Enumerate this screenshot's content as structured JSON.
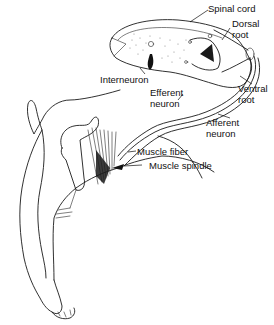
{
  "figure": {
    "colors": {
      "ink": "#1a1a1a",
      "background": "#ffffff",
      "stipple": "#8a8a8a"
    }
  },
  "labels": {
    "spinal_cord": "Spinal cord",
    "dorsal_root_1": "Dorsal",
    "dorsal_root_2": "root",
    "interneuron": "Interneuron",
    "efferent_neuron_1": "Efferent",
    "efferent_neuron_2": "neuron",
    "ventral_root_1": "Ventral",
    "ventral_root_2": "root",
    "afferent_neuron_1": "Afferent",
    "afferent_neuron_2": "neuron",
    "muscle_fiber": "Muscle fiber",
    "muscle_spindle": "Muscle spindle"
  }
}
